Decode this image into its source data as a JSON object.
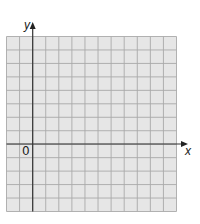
{
  "diagram": {
    "type": "coordinate-grid",
    "x_axis_label": "x",
    "y_axis_label": "y",
    "origin_label": "0",
    "columns": 13,
    "rows": 13,
    "columns_left_of_y_axis": 2,
    "rows_below_x_axis": 5,
    "colors": {
      "grid_fill": "#e6e6e6",
      "grid_line": "#a9a9a9",
      "axis": "#333333",
      "background": "#ffffff"
    }
  }
}
